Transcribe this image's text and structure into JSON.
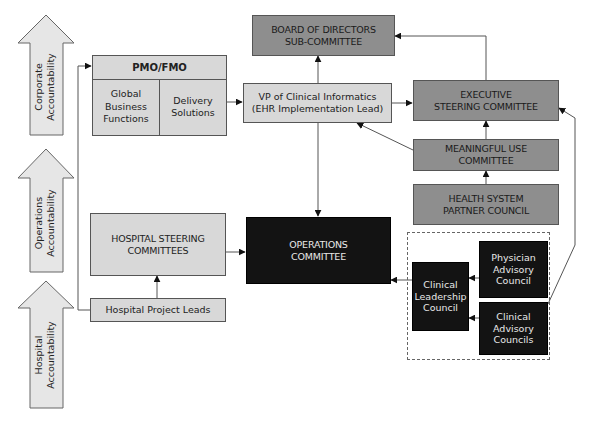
{
  "accountability_arrows": [
    {
      "id": "corporate",
      "label": "Corporate\nAccountability"
    },
    {
      "id": "operations",
      "label": "Operations\nAccountability"
    },
    {
      "id": "hospital",
      "label": "Hospital\nAccountability"
    }
  ],
  "pmo": {
    "title": "PMO/FMO",
    "left_cell": "Global\nBusiness\nFunctions",
    "right_cell": "Delivery\nSolutions"
  },
  "nodes": {
    "board": "BOARD OF DIRECTORS\nSUB-COMMITTEE",
    "vp": "VP of Clinical Informatics\n(EHR Implementation Lead)",
    "executive": "EXECUTIVE\nSTEERING COMMITTEE",
    "meaningful_use": "MEANINGFUL USE\nCOMMITTEE",
    "health_system": "HEALTH SYSTEM\nPARTNER COUNCIL",
    "hospital_steering": "HOSPITAL STEERING\nCOMMITTEES",
    "operations": "OPERATIONS\nCOMMITTEE",
    "project_leads": "Hospital Project Leads",
    "clinical_leadership": "Clinical\nLeadership\nCouncil",
    "physician_advisory": "Physician\nAdvisory\nCouncil",
    "clinical_advisory": "Clinical\nAdvisory\nCouncils"
  },
  "colors": {
    "light": "#d8d8d8",
    "mid": "#8e8e8e",
    "dark": "#131313",
    "line": "#555555"
  }
}
